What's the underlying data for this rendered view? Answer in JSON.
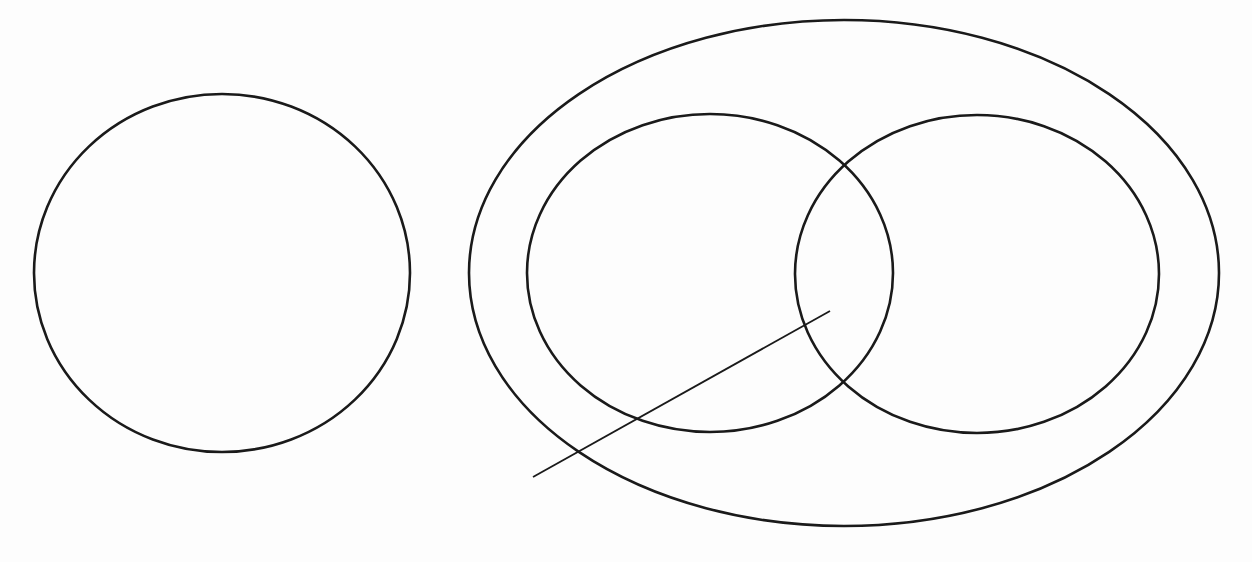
{
  "diagram": {
    "type": "venn",
    "colors": {
      "background": "#fdfdfd",
      "stroke": "#1a1a1a"
    },
    "sets": [
      {
        "id": "standalone-set",
        "label": "",
        "contained_in": null
      },
      {
        "id": "universal-set",
        "label": "",
        "contained_in": null
      },
      {
        "id": "set-a",
        "label": "",
        "contained_in": "universal-set",
        "overlaps": [
          "set-b"
        ]
      },
      {
        "id": "set-b",
        "label": "",
        "contained_in": "universal-set",
        "overlaps": [
          "set-a"
        ]
      }
    ],
    "pointer": {
      "label": "",
      "points_to": "set-a-and-set-b-intersection"
    }
  }
}
